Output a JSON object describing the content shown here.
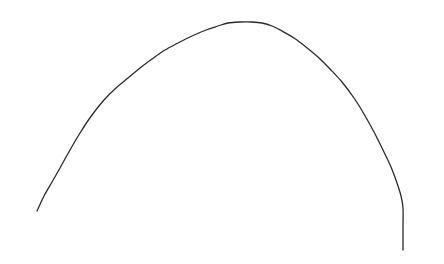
{
  "figure": {
    "title": "",
    "background_color": "#ffffff",
    "width": 444,
    "height": 264
  },
  "chart_data": {
    "type": "line",
    "title": "",
    "subtitle": "",
    "xlabel": "",
    "ylabel": "",
    "grid": false,
    "legend": null,
    "axes_visible": false,
    "tick_labels_x": [],
    "tick_labels_y": [],
    "annotations": [],
    "xlim": [
      0,
      444
    ],
    "ylim": [
      264,
      0
    ],
    "series": [
      {
        "name": "curve",
        "color": "#2a2a2a",
        "line_width": 1.3,
        "x": [
          37,
          44,
          52,
          60,
          70,
          80,
          92,
          104,
          116,
          128,
          140,
          152,
          165,
          178,
          192,
          206,
          218,
          228,
          240,
          252,
          262,
          272,
          282,
          294,
          306,
          318,
          330,
          342,
          354,
          364,
          374,
          383,
          391,
          397,
          401,
          403,
          403,
          403
        ],
        "y": [
          211,
          196,
          182,
          168,
          150,
          133,
          115,
          100,
          88,
          78,
          68,
          59,
          50,
          43,
          36,
          30,
          26,
          23,
          22,
          22,
          23,
          26,
          31,
          38,
          47,
          57,
          69,
          82,
          98,
          114,
          132,
          150,
          167,
          183,
          196,
          208,
          228,
          250
        ]
      }
    ]
  }
}
